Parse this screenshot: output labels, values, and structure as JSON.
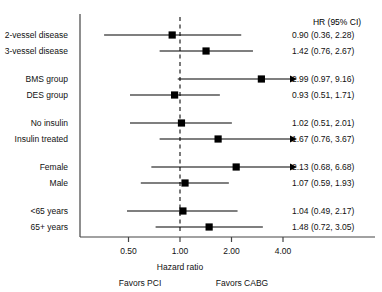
{
  "chart_data": {
    "type": "forest",
    "title": "",
    "xlabel": "Hazard ratio",
    "ylabel": "",
    "xscale": "log",
    "xlim": [
      0.3,
      6.4
    ],
    "grid": false,
    "reference_line": 1.0,
    "value_column_header": "HR (95% CI)",
    "left_direction_label": "Favors PCI",
    "right_direction_label": "Favors CABG",
    "xticks": [
      0.5,
      1.0,
      2.0,
      4.0
    ],
    "xtick_labels": [
      "0.50",
      "1.00",
      "2.00",
      "4.00"
    ],
    "colors": {
      "marker": "#000000",
      "line": "#000000",
      "reference": "#333333",
      "axis": "#444444",
      "text": "#111111"
    },
    "rows": [
      {
        "label": "2-vessel disease",
        "estimate": 0.9,
        "ci_low": 0.36,
        "ci_high": 2.28,
        "text": "0.90 (0.36, 2.28)",
        "truncated_right": false
      },
      {
        "label": "3-vessel disease",
        "estimate": 1.42,
        "ci_low": 0.76,
        "ci_high": 2.67,
        "text": "1.42 (0.76, 2.67)",
        "truncated_right": false
      },
      {
        "label": "BMS group",
        "estimate": 2.99,
        "ci_low": 0.97,
        "ci_high": 9.16,
        "text": "2.99 (0.97, 9.16)",
        "truncated_right": true
      },
      {
        "label": "DES group",
        "estimate": 0.93,
        "ci_low": 0.51,
        "ci_high": 1.71,
        "text": "0.93 (0.51, 1.71)",
        "truncated_right": false
      },
      {
        "label": "No insulin",
        "estimate": 1.02,
        "ci_low": 0.51,
        "ci_high": 2.01,
        "text": "1.02 (0.51, 2.01)",
        "truncated_right": false
      },
      {
        "label": "Insulin treated",
        "estimate": 1.67,
        "ci_low": 0.76,
        "ci_high": 3.67,
        "text": "1.67 (0.76, 3.67)",
        "truncated_right": true
      },
      {
        "label": "Female",
        "estimate": 2.13,
        "ci_low": 0.68,
        "ci_high": 6.68,
        "text": "2.13 (0.68, 6.68)",
        "truncated_right": true
      },
      {
        "label": "Male",
        "estimate": 1.07,
        "ci_low": 0.59,
        "ci_high": 1.93,
        "text": "1.07 (0.59, 1.93)",
        "truncated_right": false
      },
      {
        "label": "<65 years",
        "estimate": 1.04,
        "ci_low": 0.49,
        "ci_high": 2.17,
        "text": "1.04 (0.49, 2.17)",
        "truncated_right": false
      },
      {
        "label": "65+ years",
        "estimate": 1.48,
        "ci_low": 0.72,
        "ci_high": 3.05,
        "text": "1.48 (0.72, 3.05)",
        "truncated_right": false
      }
    ],
    "row_groups": [
      [
        0,
        1
      ],
      [
        2,
        3
      ],
      [
        4,
        5
      ],
      [
        6,
        7
      ],
      [
        8,
        9
      ]
    ]
  }
}
